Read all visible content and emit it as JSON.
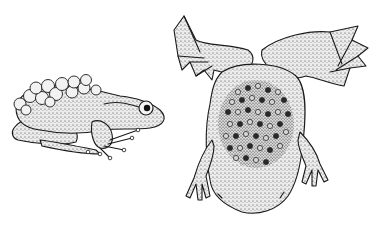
{
  "image": {
    "description": "Stippled black-and-white illustration of two frogs brooding eggs",
    "background": "#ffffff",
    "ink_color": "#1a1a1a",
    "subjects": [
      {
        "name": "egg-carrying-frog",
        "pose": "side view, crouched, facing right",
        "feature": "cluster of eggs on back"
      },
      {
        "name": "surinam-toad",
        "pose": "dorsal view, flattened body, webbed hind feet spread upward",
        "feature": "eggs embedded in back skin"
      }
    ]
  }
}
